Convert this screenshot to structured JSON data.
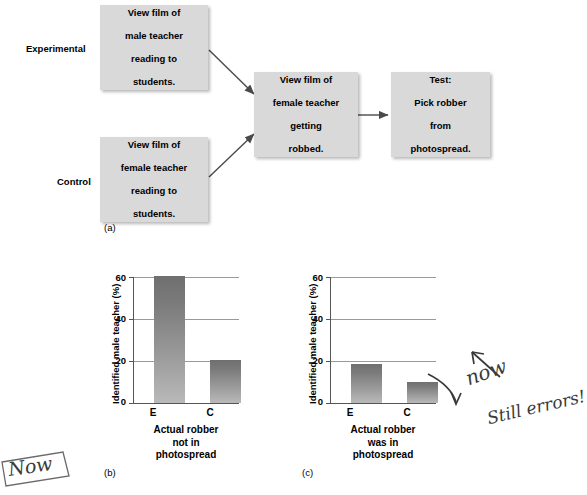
{
  "figure": {
    "panel_a_label": "(a)",
    "panel_b_label": "(b)",
    "panel_c_label": "(c)"
  },
  "flowchart": {
    "group_labels": {
      "experimental": "Experimental",
      "control": "Control"
    },
    "boxes": [
      {
        "id": "experimental-film",
        "text": "View film of male teacher reading to students."
      },
      {
        "id": "control-film",
        "text": "View film of female teacher reading to students."
      },
      {
        "id": "robbery-film",
        "text": "View film of female teacher getting robbed."
      },
      {
        "id": "test-photospread",
        "text": "Test: Pick robber from photospread."
      }
    ],
    "box_lines": {
      "experimental_film": [
        "View film of",
        "male teacher",
        "reading to",
        "students."
      ],
      "control_film": [
        "View film of",
        "female teacher",
        "reading to",
        "students."
      ],
      "robbery_film": [
        "View film of",
        "female teacher",
        "getting",
        "robbed."
      ],
      "test": [
        "Test:",
        "Pick robber",
        "from",
        "photospread."
      ]
    },
    "box_fill": "#d9d9d9",
    "arrow_color": "#4a4a4a"
  },
  "chart_data": [
    {
      "id": "panel-b",
      "type": "bar",
      "title": "",
      "categories": [
        "E",
        "C"
      ],
      "values": [
        60.5,
        20.5
      ],
      "ylabel": "Identified male teacher (%)",
      "xlabel_lines": [
        "Actual robber",
        "not in",
        "photospread"
      ],
      "yticks": [
        0,
        20,
        40,
        60
      ],
      "ylim": [
        0,
        60
      ],
      "grid": true,
      "legend": "none",
      "bar_color": "#8c8c8c"
    },
    {
      "id": "panel-c",
      "type": "bar",
      "title": "",
      "categories": [
        "E",
        "C"
      ],
      "values": [
        18.5,
        10.0
      ],
      "ylabel": "Identified male teacher (%)",
      "xlabel_lines": [
        "Actual robber",
        "was in",
        "photospread"
      ],
      "yticks": [
        0,
        20,
        40,
        60
      ],
      "ylim": [
        0,
        60
      ],
      "grid": true,
      "legend": "none",
      "bar_color": "#8c8c8c"
    }
  ],
  "annotations": {
    "handwritten_now_right": "now",
    "handwritten_still_errors": "Still errors!",
    "handwritten_now_left": "Now",
    "ink_color": "#3a3a3a"
  }
}
